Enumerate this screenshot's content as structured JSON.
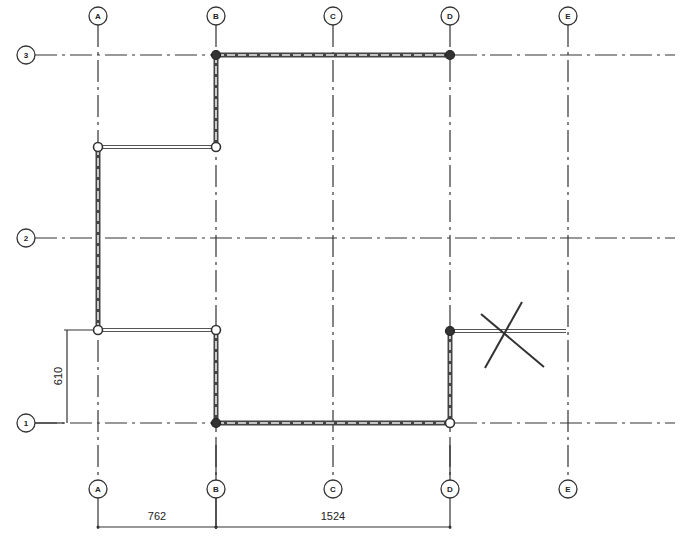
{
  "drawing": {
    "type": "structural-grid-floor-plan",
    "vertical_grids": [
      {
        "label": "A",
        "x": 98
      },
      {
        "label": "B",
        "x": 216
      },
      {
        "label": "C",
        "x": 333
      },
      {
        "label": "D",
        "x": 450
      },
      {
        "label": "E",
        "x": 568
      }
    ],
    "horizontal_grids": [
      {
        "label": "3",
        "y": 55
      },
      {
        "label": "2",
        "y": 238
      },
      {
        "label": "1",
        "y": 423
      }
    ],
    "top_bubble_y": 16,
    "bottom_bubble_y": 489,
    "left_bubble_x": 26,
    "grid_right_end_x": 675,
    "bottom_bubble_labels": [
      "A",
      "B",
      "C",
      "D",
      "E"
    ],
    "walls": [
      {
        "id": "wall-3-BD",
        "x1": 216,
        "y1": 55,
        "x2": 450,
        "y2": 55
      },
      {
        "id": "wall-B-3-top",
        "x1": 216,
        "y1": 55,
        "x2": 216,
        "y2": 147
      },
      {
        "id": "wall-A-vertical",
        "x1": 98,
        "y1": 147,
        "x2": 98,
        "y2": 330
      },
      {
        "id": "wall-B-lower",
        "x1": 216,
        "y1": 330,
        "x2": 216,
        "y2": 423
      },
      {
        "id": "wall-1-BD",
        "x1": 216,
        "y1": 423,
        "x2": 450,
        "y2": 423
      },
      {
        "id": "wall-D-lower",
        "x1": 450,
        "y1": 331,
        "x2": 450,
        "y2": 423
      }
    ],
    "beams": [
      {
        "id": "beam-upper-AB",
        "x1": 98,
        "y1": 147,
        "x2": 216,
        "y2": 147
      },
      {
        "id": "beam-lower-AB",
        "x1": 98,
        "y1": 330,
        "x2": 216,
        "y2": 330
      },
      {
        "id": "beam-cantilever-DE",
        "x1": 450,
        "y1": 331,
        "x2": 566,
        "y2": 331
      }
    ],
    "nodes": [
      {
        "x": 216,
        "y": 55,
        "solid": true
      },
      {
        "x": 450,
        "y": 55,
        "solid": true
      },
      {
        "x": 98,
        "y": 147,
        "solid": false
      },
      {
        "x": 216,
        "y": 147,
        "solid": false
      },
      {
        "x": 98,
        "y": 330,
        "solid": false
      },
      {
        "x": 216,
        "y": 330,
        "solid": false
      },
      {
        "x": 450,
        "y": 331,
        "solid": true
      },
      {
        "x": 216,
        "y": 423,
        "solid": true
      },
      {
        "x": 450,
        "y": 423,
        "solid": false
      }
    ],
    "cross_marker": {
      "line1": {
        "x1": 481,
        "y1": 314,
        "x2": 544,
        "y2": 367
      },
      "line2": {
        "x1": 485,
        "y1": 368,
        "x2": 522,
        "y2": 302
      }
    },
    "dimensions": {
      "vertical": {
        "value": "610",
        "x": 67,
        "y1": 330,
        "y2": 423
      },
      "horizontal": [
        {
          "value": "762",
          "x1": 98,
          "x2": 216,
          "y": 527
        },
        {
          "value": "1524",
          "x1": 216,
          "x2": 450,
          "y": 527
        }
      ]
    }
  },
  "labels": {
    "dim_610": "610",
    "dim_762": "762",
    "dim_1524": "1524",
    "grid_A": "A",
    "grid_B": "B",
    "grid_C": "C",
    "grid_D": "D",
    "grid_E": "E",
    "grid_1": "1",
    "grid_2": "2",
    "grid_3": "3"
  }
}
